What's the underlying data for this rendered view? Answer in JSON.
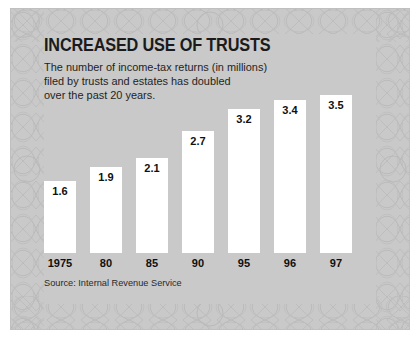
{
  "figure": {
    "title": "INCREASED USE OF TRUSTS",
    "subtitle": "The number of income-tax returns (in millions)\nfiled by trusts and estates has doubled\nover the past 20 years.",
    "source": "Source: Internal Revenue Service",
    "bar_color": "#ffffff",
    "panel_color": "#c9c9c9",
    "text_color": "#1b1b1b"
  },
  "chart_data": {
    "type": "bar",
    "title": "INCREASED USE OF TRUSTS",
    "subtitle": "The number of income-tax returns (in millions) filed by trusts and estates has doubled over the past 20 years.",
    "categories": [
      "1975",
      "80",
      "85",
      "90",
      "95",
      "96",
      "97"
    ],
    "values": [
      1.6,
      1.9,
      2.1,
      2.7,
      3.2,
      3.4,
      3.5
    ],
    "value_labels": [
      "1.6",
      "1.9",
      "2.1",
      "2.7",
      "3.2",
      "3.4",
      "3.5"
    ],
    "xlabel": "",
    "ylabel": "Income-tax returns (millions)",
    "ylim": [
      0,
      3.7
    ],
    "grid": false,
    "legend": false,
    "source": "Source: Internal Revenue Service"
  }
}
